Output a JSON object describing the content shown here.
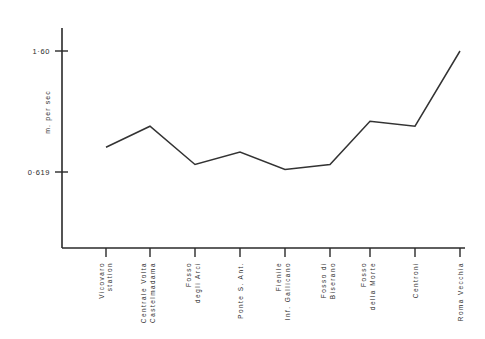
{
  "chart_data": {
    "type": "line",
    "title": "",
    "subtitle": "",
    "xlabel": "",
    "ylabel": "m. per sec",
    "grid": false,
    "legend": "none",
    "ylim": [
      0.3,
      1.72
    ],
    "ytick_labels": [
      "1·60",
      "0·619"
    ],
    "ytick_values": [
      1.6,
      0.619
    ],
    "categories": [
      "Vicovaro station",
      "Centrale Volta Castelmadama",
      "Fosso degli Arci",
      "Ponte S. Ant.",
      "Fienile Inf. Gallicano",
      "Fosso di Biserano",
      "Fosso della Morte",
      "Centroni",
      "Roma Vecchia"
    ],
    "category_lines": [
      [
        "Vicovaro",
        "station"
      ],
      [
        "Centrale Volta",
        "Castelmadama"
      ],
      [
        "Fosso",
        "degli Arci"
      ],
      [
        "Ponte S.  Ant."
      ],
      [
        "Fienile",
        "Inf. Gallicano"
      ],
      [
        "Fosso di",
        "Biserano"
      ],
      [
        "Fosso",
        "della Morte"
      ],
      [
        "Centroni"
      ],
      [
        "Roma Vecchia"
      ]
    ],
    "values": [
      0.82,
      0.99,
      0.68,
      0.78,
      0.64,
      0.68,
      1.03,
      0.99,
      1.6
    ],
    "points_px": [
      [
        106,
        147
      ],
      [
        150,
        126
      ],
      [
        195,
        164
      ],
      [
        240,
        152
      ],
      [
        285,
        170
      ],
      [
        330,
        165
      ],
      [
        370,
        122
      ],
      [
        415,
        127
      ],
      [
        460,
        52
      ]
    ],
    "colors": {
      "line": "#333333",
      "axis": "#2a2a2a",
      "text": "#2b2b2b",
      "background": "#ffffff"
    }
  }
}
